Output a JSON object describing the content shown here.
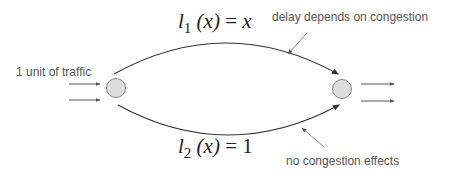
{
  "diagram": {
    "colors": {
      "edge": "#333333",
      "node_fill": "#dddddd",
      "node_stroke": "#888888",
      "pointer": "#777777",
      "annotation_text": "#555555",
      "formula_text": "#222222"
    },
    "source_label": "1 unit of traffic",
    "nodes": [
      {
        "id": "source",
        "cx": 116,
        "cy": 88,
        "r": 9
      },
      {
        "id": "sink",
        "cx": 342,
        "cy": 89,
        "r": 9
      }
    ],
    "edges": [
      {
        "id": "top",
        "cost_fn": {
          "l": "l",
          "sub": "1",
          "arg": "(x)",
          "eq": " = ",
          "rhs": "x"
        },
        "annotation": "delay depends on congestion"
      },
      {
        "id": "bottom",
        "cost_fn": {
          "l": "l",
          "sub": "2",
          "arg": "(x)",
          "eq": " = ",
          "rhs": "1"
        },
        "annotation": "no congestion effects"
      }
    ]
  }
}
